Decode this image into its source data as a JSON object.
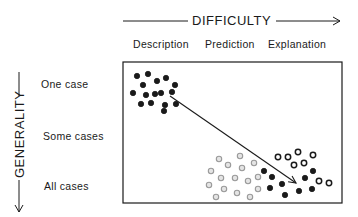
{
  "horizontal_axis": {
    "title": "DIFFICULTY",
    "columns": [
      "Description",
      "Prediction",
      "Explanation"
    ]
  },
  "vertical_axis": {
    "title": "GENERALITY",
    "rows": [
      "One case",
      "Some cases",
      "All cases"
    ]
  },
  "colors": {
    "ink": "#1a1a1a",
    "light_dot": "#9a9a9a",
    "background": "#ffffff"
  },
  "clusters": {
    "top_left_filled": [
      [
        137,
        76
      ],
      [
        148,
        74
      ],
      [
        157,
        81
      ],
      [
        166,
        78
      ],
      [
        143,
        85
      ],
      [
        175,
        85
      ],
      [
        172,
        92
      ],
      [
        133,
        93
      ],
      [
        146,
        95
      ],
      [
        155,
        94
      ],
      [
        161,
        93
      ],
      [
        141,
        104
      ],
      [
        151,
        103
      ],
      [
        165,
        105
      ],
      [
        176,
        104
      ],
      [
        164,
        111
      ]
    ],
    "bottom_light": [
      [
        219,
        159
      ],
      [
        240,
        156
      ],
      [
        228,
        165
      ],
      [
        242,
        168
      ],
      [
        254,
        163
      ],
      [
        211,
        171
      ],
      [
        221,
        178
      ],
      [
        235,
        178
      ],
      [
        248,
        181
      ],
      [
        258,
        177
      ],
      [
        209,
        185
      ],
      [
        224,
        189
      ],
      [
        237,
        193
      ],
      [
        250,
        197
      ],
      [
        216,
        197
      ],
      [
        258,
        189
      ]
    ],
    "bottom_dark": [
      [
        264,
        171
      ],
      [
        272,
        177
      ],
      [
        270,
        188
      ],
      [
        282,
        184
      ],
      [
        285,
        195
      ],
      [
        299,
        191
      ],
      [
        305,
        178
      ],
      [
        312,
        189
      ],
      [
        313,
        171
      ]
    ],
    "bottom_ring": [
      [
        278,
        157
      ],
      [
        288,
        157
      ],
      [
        298,
        152
      ],
      [
        294,
        165
      ],
      [
        304,
        163
      ],
      [
        313,
        155
      ],
      [
        319,
        181
      ],
      [
        329,
        183
      ]
    ]
  },
  "arrow": {
    "from": [
      170,
      96
    ],
    "to": [
      296,
      183
    ]
  }
}
